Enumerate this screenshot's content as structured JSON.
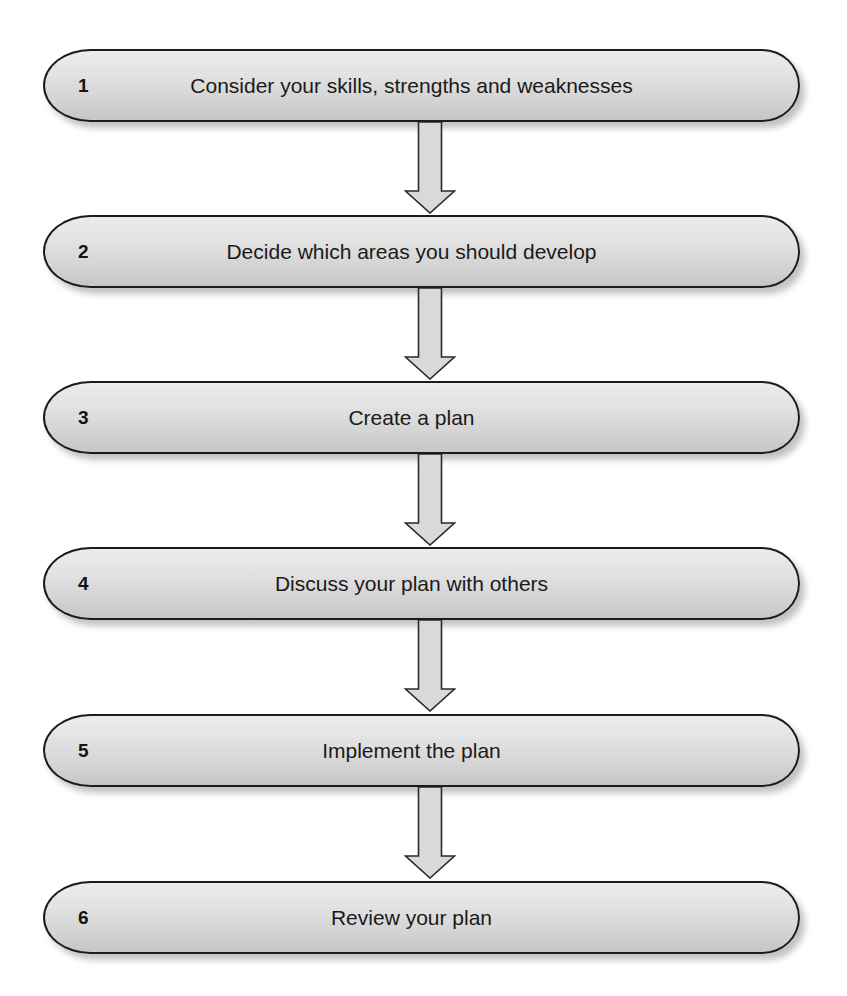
{
  "diagram": {
    "type": "vertical-flowchart",
    "steps": [
      {
        "number": "1",
        "label": "Consider your skills, strengths and weaknesses"
      },
      {
        "number": "2",
        "label": "Decide which areas you should develop"
      },
      {
        "number": "3",
        "label": "Create a plan"
      },
      {
        "number": "4",
        "label": "Discuss your plan with others"
      },
      {
        "number": "5",
        "label": "Implement the plan"
      },
      {
        "number": "6",
        "label": "Review your plan"
      }
    ],
    "connectors": [
      {
        "from": "1",
        "to": "2",
        "icon": "down-arrow-icon"
      },
      {
        "from": "2",
        "to": "3",
        "icon": "down-arrow-icon"
      },
      {
        "from": "3",
        "to": "4",
        "icon": "down-arrow-icon"
      },
      {
        "from": "4",
        "to": "5",
        "icon": "down-arrow-icon"
      },
      {
        "from": "5",
        "to": "6",
        "icon": "down-arrow-icon"
      }
    ],
    "colors": {
      "box_fill_top": "#ececec",
      "box_fill_bottom": "#c6c6c6",
      "box_border": "#1c1c1c",
      "arrow_fill": "#d9d9d9",
      "arrow_stroke": "#2a2a2a",
      "text": "#1a1a1a",
      "background": "#ffffff"
    }
  }
}
